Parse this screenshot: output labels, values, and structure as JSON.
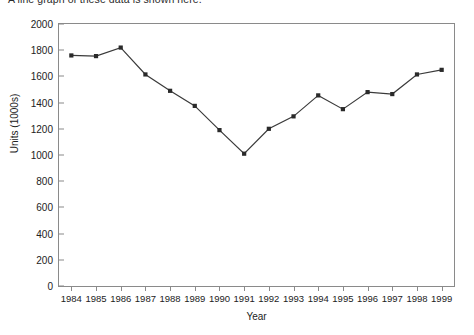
{
  "caption": "A line graph of these data is shown here.",
  "chart_data": {
    "type": "line",
    "title": "",
    "xlabel": "Year",
    "ylabel": "Units (1000s)",
    "x": [
      1984,
      1985,
      1986,
      1987,
      1988,
      1989,
      1990,
      1991,
      1992,
      1993,
      1994,
      1995,
      1996,
      1997,
      1998,
      1999
    ],
    "categories": [
      "1984",
      "1985",
      "1986",
      "1987",
      "1988",
      "1989",
      "1990",
      "1991",
      "1992",
      "1993",
      "1994",
      "1995",
      "1996",
      "1997",
      "1998",
      "1999"
    ],
    "values": [
      1760,
      1755,
      1820,
      1615,
      1490,
      1375,
      1190,
      1010,
      1200,
      1295,
      1455,
      1350,
      1480,
      1465,
      1615,
      1650
    ],
    "series": [
      {
        "name": "Units",
        "values": [
          1760,
          1755,
          1820,
          1615,
          1490,
          1375,
          1190,
          1010,
          1200,
          1295,
          1455,
          1350,
          1480,
          1465,
          1615,
          1650
        ]
      }
    ],
    "ylim": [
      0,
      2000
    ],
    "yticks": [
      0,
      200,
      400,
      600,
      800,
      1000,
      1200,
      1400,
      1600,
      1800,
      2000
    ],
    "ytick_labels": [
      "0",
      "200",
      "400",
      "600",
      "800",
      "1000",
      "1200",
      "1400",
      "1600",
      "1800",
      "2000"
    ],
    "grid": false,
    "legend": false,
    "marker": "filled-square",
    "line_color": "#3a3a3a",
    "marker_color": "#2a2a2a",
    "axis_color": "#8a8a8a"
  }
}
